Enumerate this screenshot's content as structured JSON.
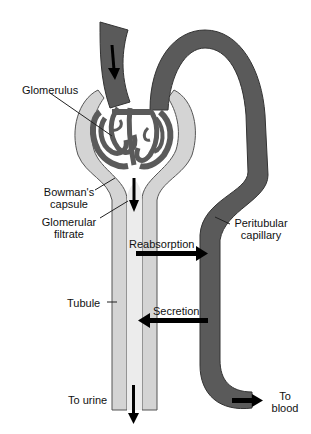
{
  "diagram": {
    "colors": {
      "capillary": "#5a5a5a",
      "capillary_stroke": "#333333",
      "capsule": "#d4d4d4",
      "tubule": "#e6e6e6",
      "stroke": "#555555",
      "arrow": "#000000",
      "background": "#ffffff"
    },
    "labels": {
      "glomerulus": "Glomerulus",
      "bowmans_capsule_1": "Bowman's",
      "bowmans_capsule_2": "capsule",
      "glomerular_filtrate_1": "Glomerular",
      "glomerular_filtrate_2": "filtrate",
      "peritubular_capillary_1": "Peritubular",
      "peritubular_capillary_2": "capillary",
      "reabsorption": "Reabsorption",
      "tubule": "Tubule",
      "secretion": "Secretion",
      "to_urine": "To urine",
      "to_blood_1": "To",
      "to_blood_2": "blood"
    },
    "arrows": [
      {
        "name": "afferent-flow",
        "direction": "down"
      },
      {
        "name": "filtrate-flow",
        "direction": "down"
      },
      {
        "name": "reabsorption",
        "direction": "right"
      },
      {
        "name": "secretion",
        "direction": "left"
      },
      {
        "name": "to-urine",
        "direction": "down"
      },
      {
        "name": "to-blood",
        "direction": "right"
      }
    ]
  }
}
